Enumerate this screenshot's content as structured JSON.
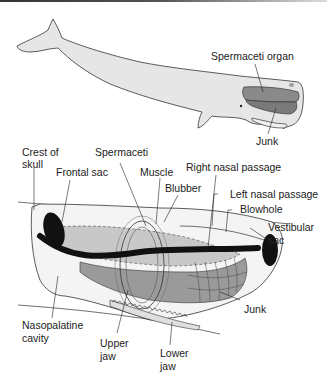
{
  "colors": {
    "body_fill": "#e6e6e6",
    "organ_dark": "#8a8a8a",
    "organ_mid": "#b4b4b4",
    "organ_light": "#cfcfcf",
    "passage": "#111111",
    "outline": "#333333"
  },
  "top_figure": {
    "labels": {
      "spermaceti_organ": "Spermaceti organ",
      "junk": "Junk"
    }
  },
  "bottom_figure": {
    "labels": {
      "crest_of_skull_1": "Crest of",
      "crest_of_skull_2": "skull",
      "frontal_sac": "Frontal sac",
      "spermaceti": "Spermaceti",
      "muscle": "Muscle",
      "blubber": "Blubber",
      "right_nasal_passage": "Right nasal passage",
      "left_nasal_passage": "Left nasal passage",
      "blowhole": "Blowhole",
      "vestibular_sac_1": "Vestibular",
      "vestibular_sac_2": "sac",
      "junk": "Junk",
      "nasopalatine_cavity_1": "Nasopalatine",
      "nasopalatine_cavity_2": "cavity",
      "upper_jaw_1": "Upper",
      "upper_jaw_2": "jaw",
      "lower_jaw_1": "Lower",
      "lower_jaw_2": "jaw"
    }
  }
}
